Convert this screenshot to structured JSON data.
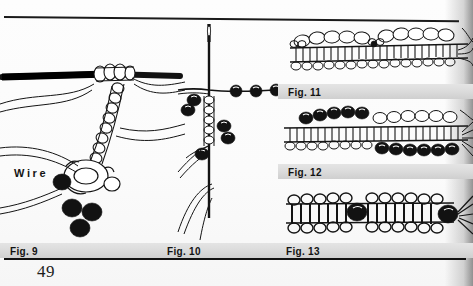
{
  "page": {
    "number": "49",
    "background_color": "#fbfbfb",
    "ink_color": "#141414",
    "caption_bar_color": "#dcdcdc"
  },
  "labels": {
    "wire": "Wire"
  },
  "figures": [
    {
      "id": "fig9",
      "caption": "Fig. 9",
      "subject": "crochet-stitches-over-wire"
    },
    {
      "id": "fig10",
      "caption": "Fig. 10",
      "subject": "needle-with-strung-beads"
    },
    {
      "id": "fig11",
      "caption": "Fig. 11",
      "subject": "beaded-crochet-strip-open-beads"
    },
    {
      "id": "fig12",
      "caption": "Fig. 12",
      "subject": "beaded-crochet-strip-dark-beads"
    },
    {
      "id": "fig13",
      "caption": "Fig. 13",
      "subject": "crochet-strip-with-accent-beads"
    }
  ],
  "captions": {
    "fig9": "Fig. 9",
    "fig10": "Fig. 10",
    "fig11": "Fig. 11",
    "fig12": "Fig. 12",
    "fig13": "Fig. 13"
  }
}
